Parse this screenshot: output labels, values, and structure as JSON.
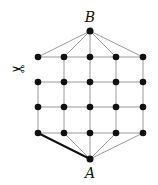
{
  "diagram": {
    "labels": {
      "top": "B",
      "bottom": "A"
    },
    "icon": "scissors-icon",
    "icon_glyph": "✂",
    "grid": {
      "columns": 5,
      "rows": 4
    },
    "cut_edge": "left column, between row 1 and row 2",
    "highlighted_edge": "A to bottom-left node",
    "colors": {
      "edge": "#9a9a9a",
      "node": "#111111",
      "highlight": "#111111"
    }
  }
}
